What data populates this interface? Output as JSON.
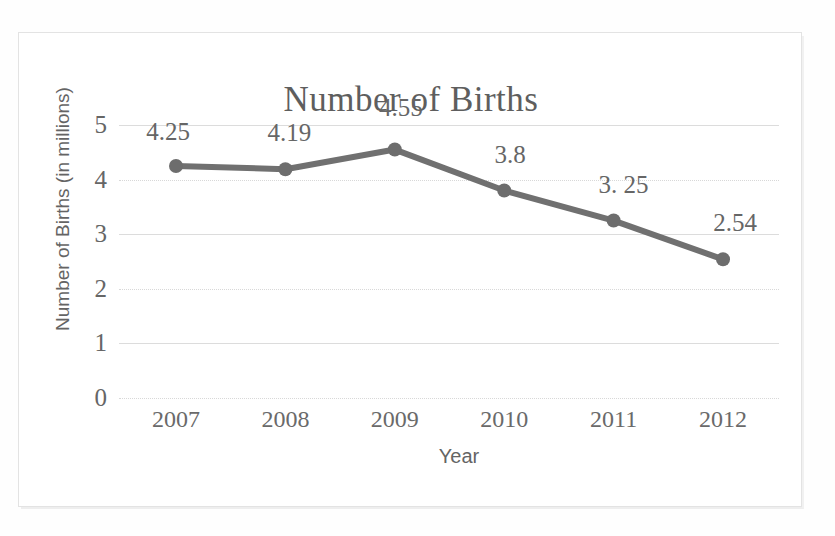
{
  "chart_data": {
    "type": "line",
    "title": "Number of Births",
    "xlabel": "Year",
    "ylabel": "Number of Births (in millions)",
    "categories": [
      "2007",
      "2008",
      "2009",
      "2010",
      "2011",
      "2012"
    ],
    "values": [
      4.25,
      4.19,
      4.55,
      3.8,
      3.25,
      2.54
    ],
    "point_labels": [
      "4.25",
      "4.19",
      "4.55",
      "3.8",
      "3. 25",
      "2.54"
    ],
    "ylim": [
      0,
      5
    ],
    "yticks": [
      "5",
      "4",
      "3",
      "2",
      "1",
      "0"
    ],
    "ytick_values": [
      5,
      4,
      3,
      2,
      1,
      0
    ],
    "grid": true,
    "legend": false,
    "series": [
      {
        "name": "Number of Births",
        "values": [
          4.25,
          4.19,
          4.55,
          3.8,
          3.25,
          2.54
        ],
        "color": "#707070",
        "marker": "circle"
      }
    ]
  },
  "colors": {
    "series_line": "#707070",
    "marker": "#6d6d6d",
    "gridline": "#dcdcdc",
    "title_text": "#5e5e5e",
    "axis_text": "#666666",
    "axis_title_text": "#646464",
    "frame_border": "#e3e3e3",
    "background": "#ffffff"
  }
}
